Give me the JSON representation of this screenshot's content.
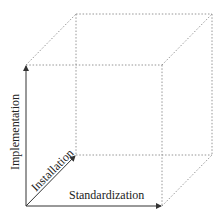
{
  "diagram": {
    "type": "3d-cube-axes",
    "axes": {
      "x": {
        "label": "Standardization"
      },
      "y": {
        "label": "Implementation"
      },
      "z": {
        "label": "Installation"
      }
    },
    "colors": {
      "axis": "#333333",
      "cube_edges": "#8a8a8a"
    }
  }
}
